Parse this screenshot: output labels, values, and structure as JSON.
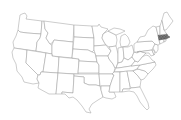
{
  "map": {
    "region": "Contiguous United States",
    "style": "state outline",
    "line_color": "#9a9a9a",
    "background_color": "#ffffff",
    "highlighted_state": {
      "name": "Massachusetts",
      "fill_color": "#555555",
      "pattern": "hatched"
    }
  }
}
